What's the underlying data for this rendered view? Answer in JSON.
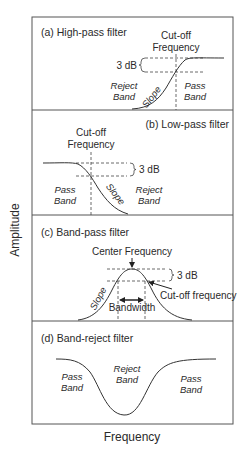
{
  "axes": {
    "y_label": "Amplitude",
    "x_label": "Frequency"
  },
  "panels": [
    {
      "title": "(a) High-pass filter",
      "cutoff_label_line1": "Cut-off",
      "cutoff_label_line2": "Frequency",
      "db_label": "3 dB",
      "reject_line1": "Reject",
      "reject_line2": "Band",
      "pass_line1": "Pass",
      "pass_line2": "Band",
      "slope_label": "Slope"
    },
    {
      "title": "(b) Low-pass filter",
      "cutoff_label_line1": "Cut-off",
      "cutoff_label_line2": "Frequency",
      "db_label": "3 dB",
      "pass_line1": "Pass",
      "pass_line2": "Band",
      "reject_line1": "Reject",
      "reject_line2": "Band",
      "slope_label": "Slope"
    },
    {
      "title": "(c) Band-pass filter",
      "center_label": "Center Frequency",
      "db_label": "3 dB",
      "cutoff_label": "Cut-off frequency",
      "bandwidth_label": "Bandwidth",
      "slope_label": "Slope"
    },
    {
      "title": "(d) Band-reject filter",
      "pass_left_line1": "Pass",
      "pass_left_line2": "Band",
      "reject_line1": "Reject",
      "reject_line2": "Band",
      "pass_right_line1": "Pass",
      "pass_right_line2": "Band"
    }
  ]
}
